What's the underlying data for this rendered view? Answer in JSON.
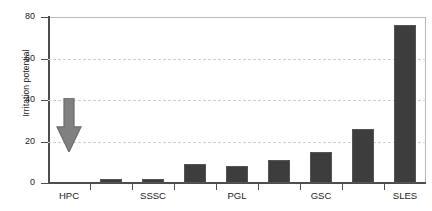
{
  "chart_data": {
    "type": "bar",
    "title": "",
    "xlabel": "",
    "ylabel": "Irritation potential",
    "ylim": [
      0,
      80
    ],
    "yticks": [
      0,
      20,
      40,
      60,
      80
    ],
    "gridlines": [
      20,
      40,
      60
    ],
    "grid": true,
    "legend": null,
    "categories": [
      "HPC",
      "",
      "SSSC",
      "",
      "PGL",
      "",
      "GSC",
      "",
      "SLES"
    ],
    "tick_labels": [
      "HPC",
      "SSSC",
      "PGL",
      "GSC",
      "SLES"
    ],
    "bars": [
      {
        "label": "HPC",
        "value": 0,
        "rendered": false
      },
      {
        "label": "",
        "value": 2,
        "rendered": true
      },
      {
        "label": "SSSC",
        "value": 2,
        "rendered": true
      },
      {
        "label": "",
        "value": 9,
        "rendered": true
      },
      {
        "label": "PGL",
        "value": 8,
        "rendered": true
      },
      {
        "label": "",
        "value": 11,
        "rendered": true
      },
      {
        "label": "GSC",
        "value": 15,
        "rendered": true
      },
      {
        "label": "",
        "value": 26,
        "rendered": true
      },
      {
        "label": "SLES",
        "value": 76,
        "rendered": true
      }
    ],
    "values": [
      0,
      2,
      2,
      9,
      8,
      11,
      15,
      26,
      76
    ],
    "annotation": {
      "type": "down-arrow",
      "from_value": 41,
      "to_value": 15,
      "at_category": "HPC",
      "color": "#808080"
    },
    "colors": {
      "bar_fill": "#3d3d3d",
      "bar_edge": "#555555",
      "arrow": "#808080",
      "grid": "#cfcfcf",
      "axis": "#4d4d4d",
      "text": "#1a1a1a",
      "background": "#ffffff"
    }
  }
}
